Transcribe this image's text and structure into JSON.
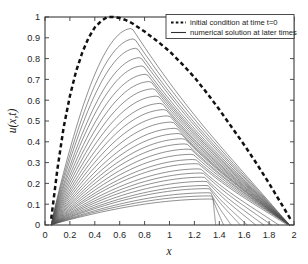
{
  "figure": {
    "background": "#ffffff",
    "width": 308,
    "height": 264
  },
  "axis_label_x": "x",
  "axis_label_y": "u(x,t)",
  "legend": {
    "position": "top-right",
    "boxed": true,
    "entries": [
      {
        "marker": "dashed",
        "label": "initial condition at time t=0"
      },
      {
        "marker": "solid",
        "label": "numerical solution at later times"
      }
    ]
  },
  "chart_data": {
    "type": "line",
    "title": "",
    "xlabel": "x",
    "ylabel": "u(x,t)",
    "xlim": [
      0,
      2
    ],
    "ylim": [
      0,
      1
    ],
    "grid": false,
    "xticks": [
      0,
      0.2,
      0.4,
      0.6,
      0.8,
      1,
      1.2,
      1.4,
      1.6,
      1.8,
      2
    ],
    "xticklabels": [
      "0",
      "0.2",
      "0.4",
      "0.6",
      "0.8",
      "1",
      "1.2",
      "1.4",
      "1.6",
      "1.8",
      "2"
    ],
    "yticks": [
      0,
      0.1,
      0.2,
      0.3,
      0.4,
      0.5,
      0.6,
      0.7,
      0.8,
      0.9,
      1
    ],
    "yticklabels": [
      "0",
      "0.1",
      "0.2",
      "0.3",
      "0.4",
      "0.5",
      "0.6",
      "0.7",
      "0.8",
      "0.9",
      "1"
    ],
    "legend_position": "upper right",
    "series": [
      {
        "name": "initial condition at time t=0",
        "style": "dashed",
        "color": "#111111",
        "peak_x": 0.55,
        "peak_y": 1.0,
        "x_start": 0.05,
        "x_end": 1.98,
        "x": [
          0.05,
          0.1,
          0.15,
          0.2,
          0.25,
          0.3,
          0.35,
          0.4,
          0.45,
          0.5,
          0.55,
          0.6,
          0.65,
          0.7,
          0.8,
          0.9,
          1.0,
          1.1,
          1.2,
          1.3,
          1.4,
          1.5,
          1.6,
          1.7,
          1.8,
          1.9,
          1.98
        ],
        "y": [
          0.03,
          0.27,
          0.47,
          0.62,
          0.74,
          0.83,
          0.9,
          0.95,
          0.98,
          1.0,
          1.0,
          0.995,
          0.985,
          0.97,
          0.93,
          0.885,
          0.835,
          0.775,
          0.71,
          0.635,
          0.555,
          0.47,
          0.385,
          0.295,
          0.2,
          0.1,
          0.02
        ]
      },
      {
        "name": "numerical solution at later times",
        "style": "solid",
        "color": "#4a4a4a",
        "curve_count": 30,
        "description": "family of decaying shock-type profiles; peaks decrease and shift right with time; all curves rooted near x=0.05 and terminate on the right along the decaying front",
        "peaks_x": [
          0.7,
          0.72,
          0.74,
          0.77,
          0.79,
          0.82,
          0.85,
          0.88,
          0.91,
          0.94,
          0.97,
          1.0,
          1.03,
          1.06,
          1.09,
          1.12,
          1.14,
          1.17,
          1.19,
          1.21,
          1.23,
          1.25,
          1.27,
          1.28,
          1.3,
          1.31,
          1.32,
          1.33,
          1.34,
          1.35
        ],
        "peaks_y": [
          0.945,
          0.895,
          0.85,
          0.805,
          0.765,
          0.725,
          0.69,
          0.655,
          0.62,
          0.585,
          0.555,
          0.525,
          0.495,
          0.465,
          0.44,
          0.415,
          0.39,
          0.365,
          0.34,
          0.315,
          0.295,
          0.27,
          0.25,
          0.23,
          0.21,
          0.19,
          0.175,
          0.155,
          0.14,
          0.125
        ]
      }
    ]
  }
}
